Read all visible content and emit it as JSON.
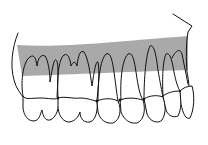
{
  "figure": {
    "band_color": "#a9a9a9",
    "line_color": "#111111",
    "background": "#ffffff",
    "tooth_count": 8
  }
}
